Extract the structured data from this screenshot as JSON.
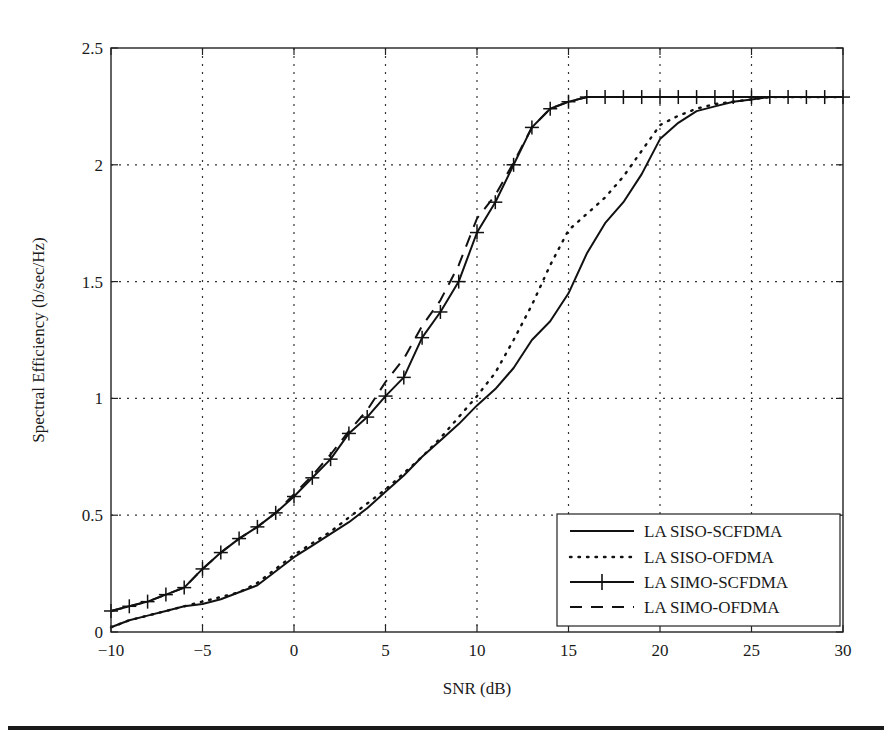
{
  "chart_data": {
    "type": "line",
    "title": "",
    "xlabel": "SNR (dB)",
    "ylabel": "Spectral Efficiency (b/sec/Hz)",
    "xlim": [
      -10,
      30
    ],
    "ylim": [
      0,
      2.5
    ],
    "xticks": [
      -10,
      -5,
      0,
      5,
      10,
      15,
      20,
      25,
      30
    ],
    "xtick_labels": [
      "−10",
      "−5",
      "0",
      "5",
      "10",
      "15",
      "20",
      "25",
      "30"
    ],
    "yticks": [
      0,
      0.5,
      1,
      1.5,
      2,
      2.5
    ],
    "ytick_labels": [
      "0",
      "0.5",
      "1",
      "1.5",
      "2",
      "2.5"
    ],
    "grid": true,
    "legend_position": "lower right",
    "x": [
      -10,
      -9,
      -8,
      -7,
      -6,
      -5,
      -4,
      -3,
      -2,
      -1,
      0,
      1,
      2,
      3,
      4,
      5,
      6,
      7,
      8,
      9,
      10,
      11,
      12,
      13,
      14,
      15,
      16,
      17,
      18,
      19,
      20,
      21,
      22,
      23,
      24,
      25,
      26,
      27,
      28,
      29,
      30
    ],
    "series": [
      {
        "name": "LA SISO-SCFDMA",
        "style": "solid",
        "marker": "none",
        "values": [
          0.02,
          0.05,
          0.07,
          0.09,
          0.11,
          0.12,
          0.14,
          0.17,
          0.2,
          0.26,
          0.32,
          0.37,
          0.42,
          0.47,
          0.53,
          0.6,
          0.67,
          0.75,
          0.82,
          0.89,
          0.97,
          1.04,
          1.13,
          1.25,
          1.33,
          1.45,
          1.62,
          1.75,
          1.84,
          1.96,
          2.11,
          2.18,
          2.23,
          2.25,
          2.27,
          2.28,
          2.29,
          2.29,
          2.29,
          2.29,
          2.29
        ]
      },
      {
        "name": "LA SISO-OFDMA",
        "style": "dotted",
        "marker": "none",
        "values": [
          0.02,
          0.05,
          0.07,
          0.09,
          0.11,
          0.13,
          0.15,
          0.17,
          0.21,
          0.27,
          0.33,
          0.38,
          0.43,
          0.49,
          0.55,
          0.61,
          0.68,
          0.75,
          0.83,
          0.92,
          1.01,
          1.11,
          1.25,
          1.4,
          1.57,
          1.72,
          1.79,
          1.86,
          1.95,
          2.06,
          2.17,
          2.21,
          2.24,
          2.26,
          2.27,
          2.28,
          2.29,
          2.29,
          2.29,
          2.29,
          2.29
        ]
      },
      {
        "name": "LA SIMO-SCFDMA",
        "style": "solid",
        "marker": "plus",
        "values": [
          0.09,
          0.11,
          0.13,
          0.16,
          0.19,
          0.27,
          0.34,
          0.4,
          0.45,
          0.51,
          0.58,
          0.66,
          0.74,
          0.85,
          0.92,
          1.01,
          1.09,
          1.26,
          1.37,
          1.5,
          1.71,
          1.84,
          2.0,
          2.16,
          2.24,
          2.27,
          2.29,
          2.29,
          2.29,
          2.29,
          2.29,
          2.29,
          2.29,
          2.29,
          2.29,
          2.29,
          2.29,
          2.29,
          2.29,
          2.29,
          2.29
        ]
      },
      {
        "name": "LA SIMO-OFDMA",
        "style": "dashed",
        "marker": "none",
        "values": [
          0.09,
          0.11,
          0.13,
          0.16,
          0.19,
          0.27,
          0.34,
          0.4,
          0.45,
          0.51,
          0.59,
          0.67,
          0.76,
          0.86,
          0.95,
          1.07,
          1.17,
          1.31,
          1.42,
          1.57,
          1.77,
          1.87,
          2.01,
          2.16,
          2.24,
          2.27,
          2.29,
          2.29,
          2.29,
          2.29,
          2.29,
          2.29,
          2.29,
          2.29,
          2.29,
          2.29,
          2.29,
          2.29,
          2.29,
          2.29,
          2.29
        ]
      }
    ]
  },
  "legend": {
    "entries": [
      "LA SISO-SCFDMA",
      "LA SISO-OFDMA",
      "LA SIMO-SCFDMA",
      "LA SIMO-OFDMA"
    ]
  },
  "axes": {
    "xlabel": "SNR (dB)",
    "ylabel": "Spectral Efficiency (b/sec/Hz)"
  }
}
